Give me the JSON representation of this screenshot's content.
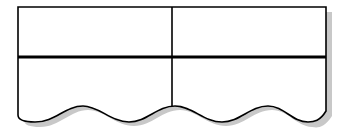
{
  "diagram": {
    "type": "table-shape",
    "rows": 2,
    "columns": 2,
    "cells": [
      [
        "",
        ""
      ],
      [
        "",
        ""
      ]
    ],
    "colors": {
      "stroke": "#000000",
      "fill": "#ffffff",
      "shadow": "#c4c4c4"
    }
  }
}
